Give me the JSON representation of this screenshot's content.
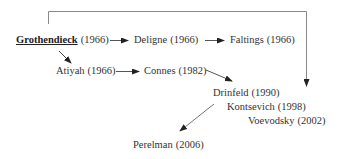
{
  "diagram": {
    "nodes": [
      {
        "id": "grothendieck",
        "name": "Grothendieck",
        "year": "(1966)",
        "emphasis": "bold-underline"
      },
      {
        "id": "deligne",
        "name": "Deligne",
        "year": "(1966)"
      },
      {
        "id": "faltings",
        "name": "Faltings",
        "year": "(1966)"
      },
      {
        "id": "atiyah",
        "name": "Atiyah",
        "year": "(1966)"
      },
      {
        "id": "connes",
        "name": "Connes",
        "year": "(1982)"
      },
      {
        "id": "drinfeld",
        "name": "Drinfeld",
        "year": "(1990)"
      },
      {
        "id": "kontsevich",
        "name": "Kontsevich",
        "year": "(1998)"
      },
      {
        "id": "voevodsky",
        "name": "Voevodsky",
        "year": "(2002)"
      },
      {
        "id": "perelman",
        "name": "Perelman",
        "year": "(2006)"
      }
    ],
    "edges": [
      {
        "from": "grothendieck",
        "to": "deligne"
      },
      {
        "from": "deligne",
        "to": "faltings"
      },
      {
        "from": "grothendieck",
        "to": "atiyah"
      },
      {
        "from": "atiyah",
        "to": "connes"
      },
      {
        "from": "connes",
        "to": "drinfeld"
      },
      {
        "from": "grothendieck",
        "to": "drinfeld",
        "style": "bracket-over-top"
      },
      {
        "from": "drinfeld",
        "to": "perelman"
      }
    ],
    "colors": {
      "text": "#333333",
      "line": "#8a8a8a",
      "arrow": "#222222"
    }
  }
}
